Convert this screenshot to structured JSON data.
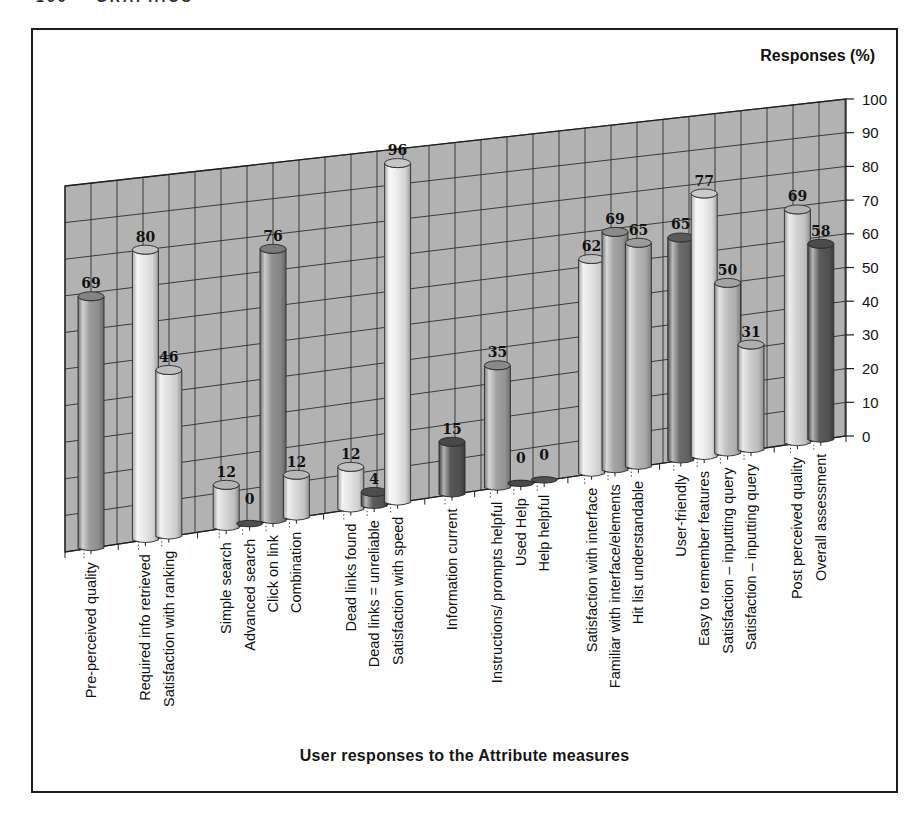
{
  "page": {
    "header_partial": "166    GRAPHICS"
  },
  "figure": {
    "y_axis_title": "Responses (%)",
    "x_axis_title": "User responses to the Attribute measures"
  },
  "chart_data": {
    "type": "bar",
    "style": "3d-cylinder",
    "title": "",
    "xlabel": "User responses to the Attribute measures",
    "ylabel": "Responses (%)",
    "ylim": [
      0,
      100
    ],
    "yticks": [
      0,
      10,
      20,
      30,
      40,
      50,
      60,
      70,
      80,
      90,
      100
    ],
    "grid": true,
    "legend": "none",
    "wall_color": "#b2b2b2",
    "grid_color": "#2e2e2e",
    "outline_color": "#1f1f1f",
    "bars": [
      {
        "label": "Pre-perceived quality",
        "value": 69,
        "group": 0,
        "shade": "#9c9c9c"
      },
      {
        "label": "Required info retrieved",
        "value": 80,
        "group": 1,
        "shade": "#e9e9e9"
      },
      {
        "label": "Satisfaction with ranking",
        "value": 46,
        "group": 1,
        "shade": "#e2e2e2"
      },
      {
        "label": "Simple search",
        "value": 12,
        "group": 2,
        "shade": "#d6d6d6"
      },
      {
        "label": "Advanced search",
        "value": 0,
        "group": 2,
        "shade": "#4f4f4f"
      },
      {
        "label": "Click on link",
        "value": 76,
        "group": 2,
        "shade": "#939393"
      },
      {
        "label": "Combination",
        "value": 12,
        "group": 2,
        "shade": "#dadada"
      },
      {
        "label": "Dead links found",
        "value": 12,
        "group": 3,
        "shade": "#e6e6e6"
      },
      {
        "label": "Dead links = unreliable",
        "value": 4,
        "group": 3,
        "shade": "#5c5c5c"
      },
      {
        "label": "Satisfaction with speed",
        "value": 96,
        "group": 3,
        "shade": "#ededed"
      },
      {
        "label": "Information current",
        "value": 15,
        "group": 4,
        "shade": "#575757"
      },
      {
        "label": "Instructions/ prompts helpful",
        "value": 35,
        "group": 5,
        "shade": "#a3a3a3"
      },
      {
        "label": "Used Help",
        "value": 0,
        "group": 5,
        "shade": "#4a4a4a"
      },
      {
        "label": "Help helpful",
        "value": 0,
        "group": 5,
        "shade": "#525252"
      },
      {
        "label": "Satisfaction with interface",
        "value": 62,
        "group": 6,
        "shade": "#e4e4e4"
      },
      {
        "label": "Familiar with interface/elements",
        "value": 69,
        "group": 6,
        "shade": "#a5a5a5"
      },
      {
        "label": "Hit list understandable",
        "value": 65,
        "group": 6,
        "shade": "#b8b8b8"
      },
      {
        "label": "User-friendly",
        "value": 65,
        "group": 7,
        "shade": "#6b6b6b"
      },
      {
        "label": "Easy to remember features",
        "value": 77,
        "group": 7,
        "shade": "#f1f1f1"
      },
      {
        "label": "Satisfaction – inputting query",
        "value": 50,
        "group": 7,
        "shade": "#c2c2c2"
      },
      {
        "label": "Satisfaction – inputting query",
        "value": 31,
        "group": 7,
        "shade": "#cfcfcf"
      },
      {
        "label": "Post perceived quality",
        "value": 69,
        "group": 8,
        "shade": "#d4d4d4"
      },
      {
        "label": "Overall assessment",
        "value": 58,
        "group": 8,
        "shade": "#5a5a5a"
      }
    ]
  }
}
